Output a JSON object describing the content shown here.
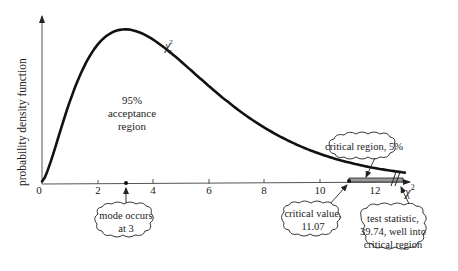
{
  "chart_data": {
    "type": "line",
    "title": "",
    "xlabel": "χ²",
    "ylabel": "probability density function",
    "xlim": [
      0,
      13
    ],
    "x_ticks": [
      0,
      2,
      4,
      6,
      8,
      10,
      12
    ],
    "x_tick_labels": [
      "0",
      "2",
      "4",
      "6",
      "8",
      "10",
      "12"
    ],
    "grid": false,
    "legend": null,
    "series": [
      {
        "name": "χ²₅",
        "label": "χ",
        "label_sub": "5",
        "label_sup": "2",
        "degrees_of_freedom": 5,
        "x": [
          0,
          0.5,
          1,
          1.5,
          2,
          2.5,
          3,
          3.5,
          4,
          4.5,
          5,
          5.5,
          6,
          6.5,
          7,
          7.5,
          8,
          8.5,
          9,
          9.5,
          10,
          10.5,
          11,
          11.5,
          12,
          12.5,
          13
        ],
        "y": [
          0,
          0.037,
          0.081,
          0.115,
          0.138,
          0.15,
          0.154,
          0.151,
          0.144,
          0.134,
          0.122,
          0.109,
          0.097,
          0.085,
          0.074,
          0.063,
          0.054,
          0.046,
          0.039,
          0.033,
          0.028,
          0.023,
          0.019,
          0.016,
          0.013,
          0.011,
          0.009
        ]
      }
    ],
    "annotations": {
      "acceptance_region": {
        "line1": "95%",
        "line2": "acceptance",
        "line3": "region"
      },
      "critical_region": {
        "text": "critical region, 5%",
        "from": 11.07
      },
      "mode": {
        "line1": "mode occurs",
        "line2": "at 3",
        "x": 3
      },
      "critical_value": {
        "line1": "critical value,",
        "line2": "11.07",
        "x": 11.07
      },
      "test_statistic": {
        "line1": "test statistic,",
        "line2": "39.74, well into",
        "line3": "critical region",
        "value": 39.74
      }
    },
    "axis_break": "//"
  }
}
